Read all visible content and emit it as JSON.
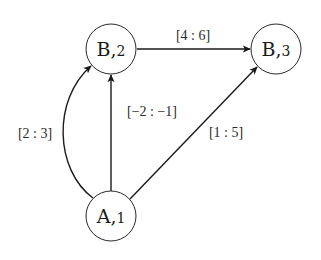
{
  "diagram": {
    "type": "directed-graph",
    "colors": {
      "background": "#ffffff",
      "stroke": "#1a1a1a",
      "text": "#1a1a1a"
    },
    "nodes": [
      {
        "id": "B2",
        "main": "B,",
        "sub": "2",
        "label": "B,2"
      },
      {
        "id": "B3",
        "main": "B,",
        "sub": "3",
        "label": "B,3"
      },
      {
        "id": "A1",
        "main": "A,",
        "sub": "1",
        "label": "A,1"
      }
    ],
    "edges": [
      {
        "from": "B2",
        "to": "B3",
        "label": "[4 : 6]",
        "shape": "straight"
      },
      {
        "from": "A1",
        "to": "B2",
        "label": "[2 : 3]",
        "shape": "curved-left"
      },
      {
        "from": "A1",
        "to": "B2",
        "label": "[−2 : −1]",
        "shape": "straight"
      },
      {
        "from": "A1",
        "to": "B3",
        "label": "[1 : 5]",
        "shape": "straight"
      }
    ]
  }
}
